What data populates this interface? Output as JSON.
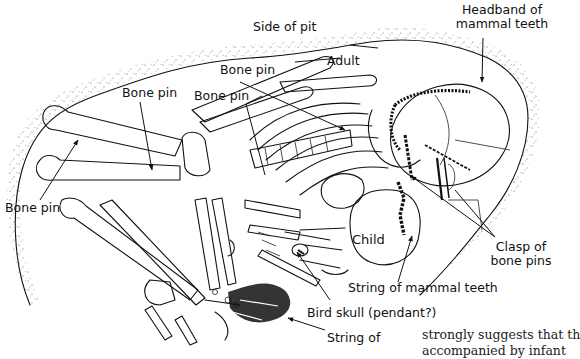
{
  "figure": {
    "type": "archaeological burial plan drawing",
    "labels": {
      "side_of_pit": "Side of pit",
      "headband": [
        "Headband of",
        "mammal teeth"
      ],
      "adult": "Adult",
      "bone_pin_1": "Bone pin",
      "bone_pin_2": "Bone pin",
      "bone_pin_3": "Bone pin",
      "bone_pin_4": "Bone pin",
      "child": "Child",
      "clasp": [
        "Clasp of",
        "bone pins"
      ],
      "string_teeth": "String of mammal teeth",
      "bird_skull": "Bird skull (pendant?)",
      "string_of": "String of"
    }
  },
  "body_text": {
    "line1": "strongly suggests that th",
    "line2": "accompanied by infant"
  }
}
